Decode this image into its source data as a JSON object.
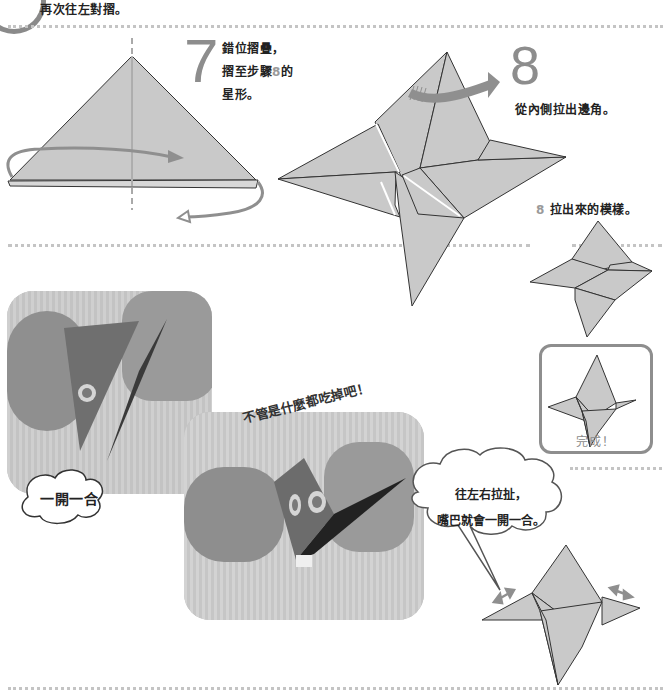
{
  "page": {
    "step6": {
      "number": "6",
      "caption": "再次往左對摺。"
    },
    "step7": {
      "number": "7",
      "caption_lines": [
        "錯位摺疊，",
        "摺至步驟",
        "的",
        "星形。"
      ],
      "ref_step": "8"
    },
    "step8": {
      "number": "8",
      "caption": "從內側拉出邊角。"
    },
    "step8_result": {
      "ref_step": "8",
      "caption": "拉出來的模樣。"
    },
    "finished": {
      "label": "完成！"
    },
    "photo_callout": {
      "tilted_text": "不管是什麼都吃掉吧！",
      "cloud_label": "一開一合"
    },
    "instruction_bubble": {
      "lines": [
        "往左右拉扯，",
        "嘴巴就會一開一合。"
      ]
    }
  },
  "colors": {
    "paper_fill": "#c9c9c9",
    "paper_stroke": "#333333",
    "number_grey": "#8d8d8d",
    "arrow_grey": "#8f8f8f",
    "dotted_rule": "#c4c4c4"
  }
}
